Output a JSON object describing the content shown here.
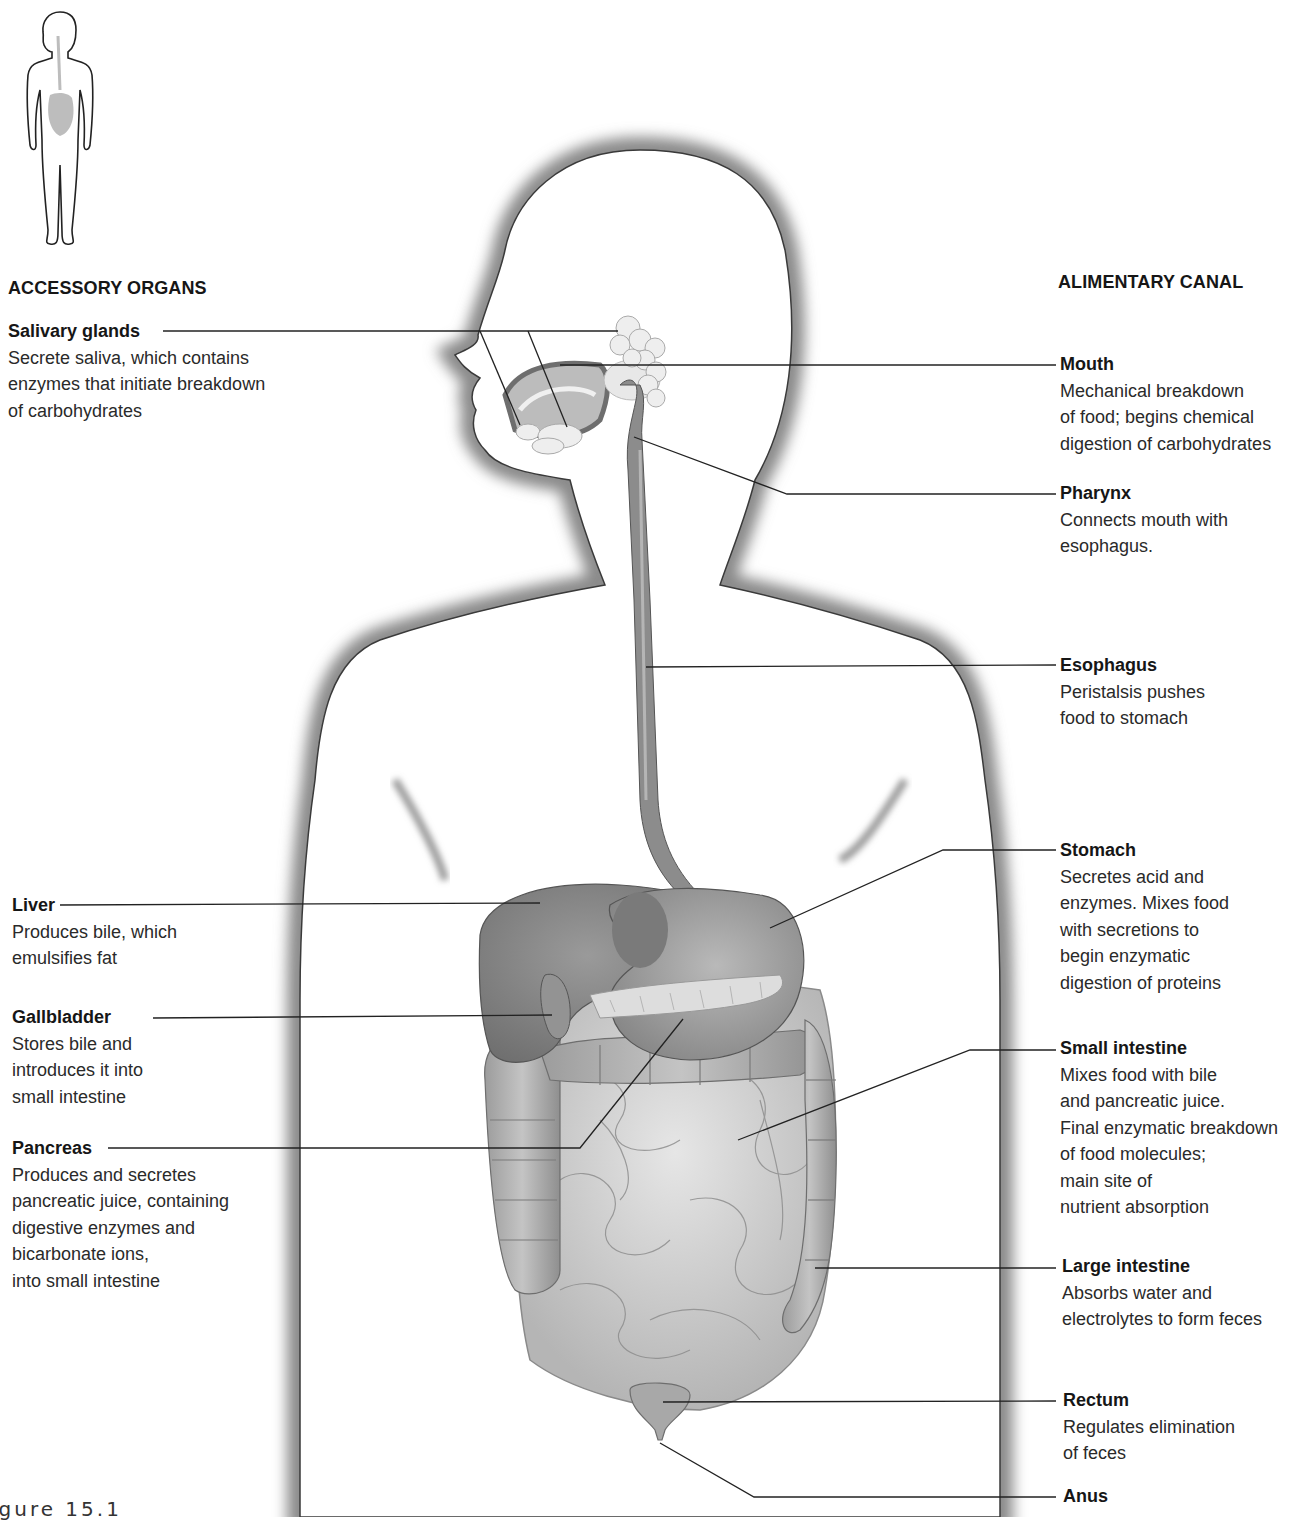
{
  "diagram": {
    "sections": {
      "accessory": "ACCESSORY ORGANS",
      "alimentary": "ALIMENTARY CANAL"
    },
    "accessory_organs": [
      {
        "name": "Salivary glands",
        "desc": "Secrete saliva, which contains\nenzymes that initiate breakdown\nof carbohydrates"
      },
      {
        "name": "Liver",
        "desc": "Produces bile, which\nemulsifies fat"
      },
      {
        "name": "Gallbladder",
        "desc": "Stores bile and\nintroduces it into\nsmall intestine"
      },
      {
        "name": "Pancreas",
        "desc": "Produces and secretes\npancreatic juice, containing\ndigestive enzymes and\nbicarbonate ions,\ninto small intestine"
      }
    ],
    "alimentary_canal": [
      {
        "name": "Mouth",
        "desc": "Mechanical breakdown\nof food; begins chemical\ndigestion of carbohydrates"
      },
      {
        "name": "Pharynx",
        "desc": "Connects mouth with\nesophagus."
      },
      {
        "name": "Esophagus",
        "desc": "Peristalsis pushes\nfood to stomach"
      },
      {
        "name": "Stomach",
        "desc": "Secretes acid and\nenzymes. Mixes food\nwith secretions to\nbegin enzymatic\ndigestion of proteins"
      },
      {
        "name": "Small intestine",
        "desc": "Mixes food with bile\nand pancreatic juice.\nFinal enzymatic breakdown\nof food molecules;\nmain site of\nnutrient absorption"
      },
      {
        "name": "Large intestine",
        "desc": "Absorbs water and\nelectrolytes to form feces"
      },
      {
        "name": "Rectum",
        "desc": "Regulates elimination\nof feces"
      },
      {
        "name": "Anus",
        "desc": ""
      }
    ],
    "caption": "igure 15.1",
    "colors": {
      "leader_line": "#222222",
      "body_shade": "#8a8a8a",
      "organ_dark": "#7d7d7d",
      "organ_mid": "#a8a8a8",
      "organ_light": "#d2d2d2"
    }
  }
}
